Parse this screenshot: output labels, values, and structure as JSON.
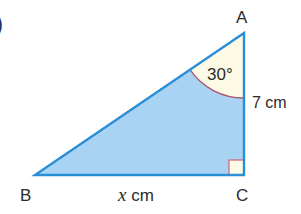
{
  "figure": {
    "partial_label": ")",
    "vertices": {
      "A": {
        "label": "A"
      },
      "B": {
        "label": "B"
      },
      "C": {
        "label": "C"
      }
    },
    "angle_A": {
      "label": "30°",
      "degrees": 30
    },
    "side_AC": {
      "label": "7 cm",
      "value": 7,
      "unit": "cm"
    },
    "side_BC": {
      "var": "x",
      "unit": "cm"
    },
    "right_angle_at": "C"
  },
  "colors": {
    "triangle_fill": "#a9d3f3",
    "triangle_stroke": "#2a8ed6",
    "angle_fill": "#fdfbe6",
    "angle_stroke": "#b0506e",
    "text": "#2b2b2b"
  }
}
